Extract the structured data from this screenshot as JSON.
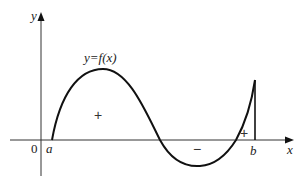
{
  "diagram": {
    "axes": {
      "x_label": "x",
      "y_label": "y",
      "origin_label": "0"
    },
    "curve_label": "y=f(x)",
    "points": {
      "a_label": "a",
      "b_label": "b"
    },
    "regions": [
      {
        "sign": "+",
        "position": "first hump above x-axis"
      },
      {
        "sign": "−",
        "position": "trough below x-axis"
      },
      {
        "sign": "+",
        "position": "small region above x-axis near b"
      }
    ],
    "colors": {
      "stroke": "#111111",
      "background": "#ffffff"
    }
  }
}
